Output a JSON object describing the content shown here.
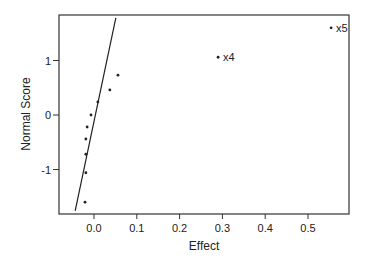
{
  "chart_data": {
    "type": "scatter",
    "title": "",
    "xlabel": "Effect",
    "ylabel": "Normal Score",
    "xlim": [
      -0.082,
      0.595
    ],
    "ylim": [
      -1.82,
      1.83
    ],
    "x_ticks": [
      0.0,
      0.1,
      0.2,
      0.3,
      0.4,
      0.5
    ],
    "x_tick_labels": [
      "0.0",
      "0.1",
      "0.2",
      "0.3",
      "0.4",
      "0.5"
    ],
    "y_ticks": [
      -1,
      0,
      1
    ],
    "y_tick_labels": [
      "-1",
      "0",
      "1"
    ],
    "grid": false,
    "legend": null,
    "points": [
      {
        "effect": -0.021,
        "score": -1.6,
        "label": ""
      },
      {
        "effect": -0.019,
        "score": -1.06,
        "label": ""
      },
      {
        "effect": -0.019,
        "score": -0.72,
        "label": ""
      },
      {
        "effect": -0.019,
        "score": -0.44,
        "label": ""
      },
      {
        "effect": -0.016,
        "score": -0.22,
        "label": ""
      },
      {
        "effect": -0.007,
        "score": 0.0,
        "label": ""
      },
      {
        "effect": 0.009,
        "score": 0.24,
        "label": ""
      },
      {
        "effect": 0.037,
        "score": 0.46,
        "label": ""
      },
      {
        "effect": 0.056,
        "score": 0.73,
        "label": ""
      },
      {
        "effect": 0.29,
        "score": 1.06,
        "label": "x4"
      },
      {
        "effect": 0.554,
        "score": 1.6,
        "label": "x5"
      }
    ],
    "reference_line": {
      "x1": -0.044,
      "y1": -1.76,
      "x2": 0.051,
      "y2": 1.78
    },
    "annotations": [
      "x4",
      "x5"
    ]
  }
}
